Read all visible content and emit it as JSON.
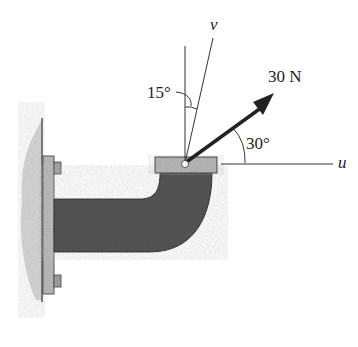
{
  "diagram": {
    "type": "force-resolution",
    "force": {
      "label": "30 N",
      "magnitude": 30,
      "unit": "N",
      "angle_from_u_deg": 30
    },
    "axes": {
      "u_label": "u",
      "v_label": "v"
    },
    "angles": {
      "v_from_vertical": "15°",
      "force_from_u": "30°"
    },
    "colors": {
      "bracket": "#5a5a5a",
      "plate": "#b8b8b8",
      "wall": "#d9d9d9",
      "line": "#333333"
    }
  }
}
